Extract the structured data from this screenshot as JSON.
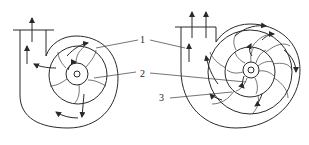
{
  "diagram": {
    "type": "centrifugal pump schematic",
    "left_figure": {
      "name": "volute-pump",
      "blade_count": 6
    },
    "right_figure": {
      "name": "diffuser-pump",
      "blade_count": 8,
      "diffuser_vane_count": 8
    },
    "labels": [
      {
        "id": "1",
        "text": "1"
      },
      {
        "id": "2",
        "text": "2"
      },
      {
        "id": "3",
        "text": "3"
      }
    ],
    "colors": {
      "stroke": "#2a2a2a",
      "background": "#ffffff"
    }
  }
}
